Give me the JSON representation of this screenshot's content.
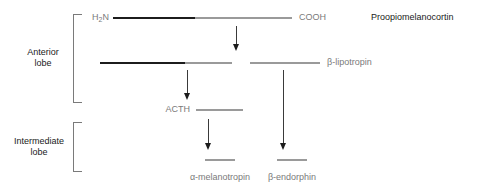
{
  "diagram": {
    "colors": {
      "peptide_black": "#1c1c1c",
      "peptide_gray": "#9a9a9a",
      "label_gray": "#7a7a7a",
      "label_dark": "#1a1a1a",
      "arrow": "#1c1c1c",
      "background": "#ffffff"
    },
    "brackets": [
      {
        "name": "anterior-lobe",
        "line1": "Anterior",
        "line2": "lobe"
      },
      {
        "name": "intermediate-lobe",
        "line1": "Intermediate",
        "line2": "lobe"
      }
    ],
    "terminal_labels": {
      "n_terminus_pre": "H",
      "n_terminus_sub": "2",
      "n_terminus_post": "N",
      "c_terminus": "COOH"
    },
    "peptides": [
      {
        "name": "proopiomelanocortin",
        "label": "Proopiomelanocortin"
      },
      {
        "name": "beta-lipotropin",
        "label": "β-lipotropin"
      },
      {
        "name": "acth",
        "label": "ACTH"
      },
      {
        "name": "alpha-melanotropin",
        "label": "α-melanotropin"
      },
      {
        "name": "beta-endorphin",
        "label": "β-endorphin"
      }
    ]
  }
}
